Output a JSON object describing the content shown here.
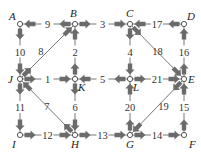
{
  "diagram": {
    "type": "directed-network",
    "colors": {
      "arrow": "#6b6b6b",
      "line": "#555555",
      "node_fill": "#ffffff",
      "node_stroke": "#444444",
      "text": "#222222"
    },
    "nodes": [
      {
        "id": "A",
        "label": "A",
        "x": 20,
        "y": 24,
        "lx": 9,
        "ly": 20
      },
      {
        "id": "B",
        "label": "B",
        "x": 75,
        "y": 24,
        "lx": 70,
        "ly": 17
      },
      {
        "id": "C",
        "label": "C",
        "x": 130,
        "y": 24,
        "lx": 126,
        "ly": 17
      },
      {
        "id": "D",
        "label": "D",
        "x": 184,
        "y": 24,
        "lx": 187,
        "ly": 20
      },
      {
        "id": "J",
        "label": "J",
        "x": 20,
        "y": 79,
        "lx": 8,
        "ly": 83
      },
      {
        "id": "K",
        "label": "K",
        "x": 75,
        "y": 79,
        "lx": 78,
        "ly": 91
      },
      {
        "id": "L",
        "label": "L",
        "x": 130,
        "y": 79,
        "lx": 133,
        "ly": 91
      },
      {
        "id": "E",
        "label": "E",
        "x": 184,
        "y": 79,
        "lx": 188,
        "ly": 83
      },
      {
        "id": "I",
        "label": "I",
        "x": 20,
        "y": 135,
        "lx": 12,
        "ly": 148
      },
      {
        "id": "H",
        "label": "H",
        "x": 75,
        "y": 135,
        "lx": 71,
        "ly": 148
      },
      {
        "id": "G",
        "label": "G",
        "x": 130,
        "y": 135,
        "lx": 126,
        "ly": 148
      },
      {
        "id": "F",
        "label": "F",
        "x": 184,
        "y": 135,
        "lx": 189,
        "ly": 148
      }
    ],
    "edges": [
      {
        "id": 1,
        "label": "1",
        "from": "J",
        "to": "K"
      },
      {
        "id": 2,
        "label": "2",
        "from": "K",
        "to": "B"
      },
      {
        "id": 3,
        "label": "3",
        "from": "B",
        "to": "C"
      },
      {
        "id": 4,
        "label": "4",
        "from": "C",
        "to": "L"
      },
      {
        "id": 5,
        "label": "5",
        "from": "L",
        "to": "K"
      },
      {
        "id": 6,
        "label": "6",
        "from": "K",
        "to": "H"
      },
      {
        "id": 7,
        "label": "7",
        "from": "H",
        "to": "J"
      },
      {
        "id": 8,
        "label": "8",
        "from": "J",
        "to": "B"
      },
      {
        "id": 9,
        "label": "9",
        "from": "B",
        "to": "A"
      },
      {
        "id": 10,
        "label": "10",
        "from": "A",
        "to": "J"
      },
      {
        "id": 11,
        "label": "11",
        "from": "J",
        "to": "I"
      },
      {
        "id": 12,
        "label": "12",
        "from": "I",
        "to": "H"
      },
      {
        "id": 13,
        "label": "13",
        "from": "H",
        "to": "G"
      },
      {
        "id": 14,
        "label": "14",
        "from": "G",
        "to": "F"
      },
      {
        "id": 15,
        "label": "15",
        "from": "F",
        "to": "E"
      },
      {
        "id": 16,
        "label": "16",
        "from": "E",
        "to": "D"
      },
      {
        "id": 17,
        "label": "17",
        "from": "D",
        "to": "C"
      },
      {
        "id": 18,
        "label": "18",
        "from": "C",
        "to": "E"
      },
      {
        "id": 19,
        "label": "19",
        "from": "E",
        "to": "G"
      },
      {
        "id": 20,
        "label": "20",
        "from": "G",
        "to": "L"
      },
      {
        "id": 21,
        "label": "21",
        "from": "L",
        "to": "E"
      }
    ]
  }
}
